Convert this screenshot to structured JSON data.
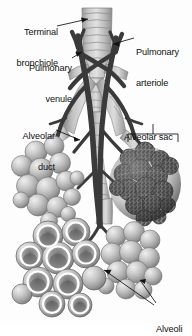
{
  "figure": {
    "background_color": "#fdfdfd",
    "ink_color": "#111111",
    "tube_light": "#d8d8d8",
    "tube_mid": "#b4b4b4",
    "tube_dark": "#8a8a8a",
    "vessel_color": "#3a3a3a",
    "sac_dark": "#4a4a4a",
    "alveoli_light": "#cfcfcf"
  },
  "labels": {
    "terminal_bronchiole": {
      "line1": "Terminal",
      "line2": "bronchiole"
    },
    "pulmonary_venule": {
      "line1": "Pulmonary",
      "line2": "venule"
    },
    "pulmonary_arteriole": {
      "line1": "Pulmonary",
      "line2": "arteriole"
    },
    "alveolar_duct": {
      "line1": "Alveolar",
      "line2": "duct"
    },
    "alveolar_sac": {
      "line1": "Alveolar sac"
    },
    "alveoli": {
      "line1": "Alveoli"
    }
  }
}
